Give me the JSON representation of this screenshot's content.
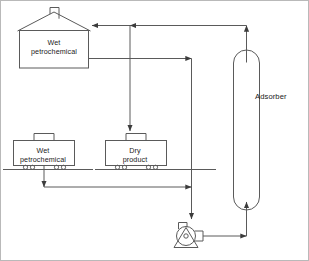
{
  "diagram": {
    "type": "process-flow-diagram",
    "colors": {
      "line": "#5a5a5a",
      "line_dark": "#3c3c3c",
      "text": "#1a1a1a",
      "background": "#ffffff",
      "frame": "#b9b9b9"
    },
    "nodes": [
      {
        "id": "building",
        "shape": "house",
        "label": "Wet\npetrochemical",
        "label_line_1": "Wet",
        "label_line_2": "petrochemical",
        "x": 18,
        "y": 10,
        "width": 70,
        "height": 57
      },
      {
        "id": "railcar-wet",
        "shape": "hopper-railcar",
        "label_line_1": "Wet",
        "label_line_2": "petrochemical",
        "x": 12,
        "y": 138,
        "width": 62,
        "height": 28,
        "wheels": 4
      },
      {
        "id": "railcar-dry",
        "shape": "hopper-railcar",
        "label_line_1": "Dry",
        "label_line_2": "product",
        "x": 104,
        "y": 138,
        "width": 62,
        "height": 28,
        "wheels": 4
      },
      {
        "id": "adsorber",
        "shape": "vertical-vessel",
        "label": "Adsorber",
        "x": 232,
        "y": 48,
        "width": 26,
        "height": 162
      },
      {
        "id": "pump",
        "shape": "centrifugal-pump",
        "label": "",
        "x": 168,
        "y": 222,
        "width": 38,
        "height": 26
      }
    ],
    "labels": {
      "building": "Wet\npetrochemical",
      "building_line_1": "Wet",
      "building_line_2": "petrochemical",
      "railcar_wet_line_1": "Wet",
      "railcar_wet_line_2": "petrochemical",
      "railcar_dry_line_1": "Dry",
      "railcar_dry_line_2": "product",
      "adsorber": "Adsorber"
    },
    "streams": [
      {
        "id": "s1",
        "from": "adsorber-top",
        "to": "building",
        "desc": "dry gas return to building",
        "arrowheads": 2
      },
      {
        "id": "s2",
        "from": "building",
        "to": "down-riser",
        "desc": "building outlet to riser"
      },
      {
        "id": "s3",
        "from": "top-header",
        "to": "railcar-dry",
        "desc": "dry product drop to railcar"
      },
      {
        "id": "s4",
        "from": "railcar-wet",
        "to": "pump-suction",
        "desc": "wet feed to pump suction"
      },
      {
        "id": "s5",
        "from": "pump-discharge",
        "to": "adsorber-bottom",
        "desc": "pump discharge to adsorber inlet"
      }
    ]
  }
}
